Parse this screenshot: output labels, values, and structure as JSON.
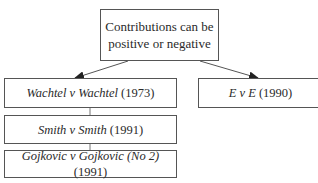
{
  "diagram": {
    "root": {
      "line1": "Contributions can be",
      "line2": "positive or negative"
    },
    "left_branch": [
      {
        "case_italic": "Wachtel v Wachtel",
        "year": " (1973)"
      },
      {
        "case_italic": "Smith v Smith",
        "year": " (1991)"
      },
      {
        "case_italic": "Gojkovic v Gojkovic (No 2)",
        "year": " (1991)"
      }
    ],
    "right_branch": [
      {
        "case_italic": "E v E",
        "year": " (1990)"
      }
    ],
    "colors": {
      "border": "#555555",
      "text": "#2a2a2a",
      "arrow": "#333333"
    }
  }
}
